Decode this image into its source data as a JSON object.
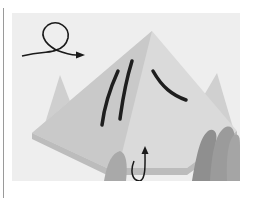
{
  "figure": {
    "symbols": [
      {
        "name": "turn-over-loop-arrow",
        "position": "top-left"
      },
      {
        "name": "fold-up-arrow",
        "position": "bottom-center"
      }
    ],
    "colors": {
      "background": "#ffffff",
      "paper_light": "#dcdcdc",
      "paper_dark": "#bdbdbd",
      "stroke": "#1e1e1e",
      "edge_line": "#9a9a9a"
    }
  }
}
